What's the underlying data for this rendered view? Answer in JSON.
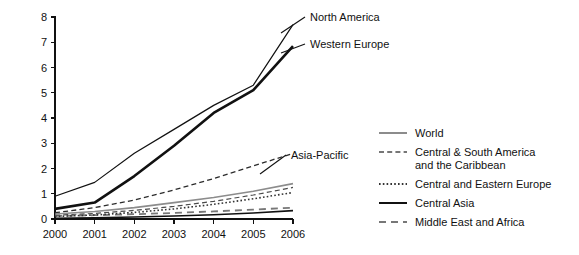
{
  "chart_data": {
    "type": "line",
    "title": "",
    "subtitle": "",
    "xlabel": "",
    "ylabel": "",
    "x": [
      2000,
      2001,
      2002,
      2003,
      2004,
      2005,
      2006
    ],
    "xtick_labels": [
      "2000",
      "2001",
      "2002",
      "2003",
      "2004",
      "2005",
      "2006"
    ],
    "ytick_labels": [
      "0",
      "1",
      "2",
      "3",
      "4",
      "5",
      "6",
      "7",
      "8"
    ],
    "ytick_values": [
      0,
      1,
      2,
      3,
      4,
      5,
      6,
      7,
      8
    ],
    "xlim": [
      2000,
      2006
    ],
    "ylim": [
      0,
      8
    ],
    "grid": false,
    "legend_position": "right",
    "series": [
      {
        "name": "North America",
        "values": [
          0.9,
          1.45,
          2.6,
          3.55,
          4.5,
          5.3,
          7.7
        ],
        "style": "solid",
        "width": 1.2,
        "color": "#111111",
        "labeled_on_plot": true
      },
      {
        "name": "Western Europe",
        "values": [
          0.4,
          0.65,
          1.7,
          2.9,
          4.2,
          5.1,
          6.85
        ],
        "style": "solid",
        "width": 2.6,
        "color": "#111111",
        "labeled_on_plot": true
      },
      {
        "name": "Asia-Pacific",
        "values": [
          0.25,
          0.45,
          0.75,
          1.15,
          1.6,
          2.1,
          2.6
        ],
        "style": "dashed",
        "width": 1.3,
        "color": "#2b2b2b",
        "labeled_on_plot": true
      },
      {
        "name": "World",
        "values": [
          0.2,
          0.3,
          0.45,
          0.65,
          0.85,
          1.1,
          1.4
        ],
        "style": "solid",
        "width": 1.6,
        "color": "#8c8c8c",
        "labeled_on_plot": false
      },
      {
        "name": "Central & South America and the Caribbean",
        "values": [
          0.15,
          0.22,
          0.34,
          0.5,
          0.7,
          0.95,
          1.25
        ],
        "style": "dashed",
        "width": 1.2,
        "color": "#4a4a4a",
        "labeled_on_plot": false
      },
      {
        "name": "Central and Eastern Europe",
        "values": [
          0.1,
          0.16,
          0.26,
          0.4,
          0.58,
          0.8,
          1.05
        ],
        "style": "dotted",
        "width": 1.6,
        "color": "#333333",
        "labeled_on_plot": false
      },
      {
        "name": "Central Asia",
        "values": [
          0.03,
          0.05,
          0.08,
          0.12,
          0.17,
          0.24,
          0.33
        ],
        "style": "solid",
        "width": 1.6,
        "color": "#111111",
        "labeled_on_plot": false
      },
      {
        "name": "Middle East and Africa",
        "values": [
          0.12,
          0.15,
          0.19,
          0.24,
          0.3,
          0.37,
          0.45
        ],
        "style": "longdash",
        "width": 1.8,
        "color": "#777777",
        "labeled_on_plot": false
      }
    ],
    "plot_annotations": [
      {
        "label": "North America",
        "x": 2006,
        "y": 7.7
      },
      {
        "label": "Western Europe",
        "x": 2006,
        "y": 6.85
      },
      {
        "label": "Asia-Pacific",
        "x": 2006,
        "y": 2.6
      }
    ],
    "legend": {
      "entries": [
        {
          "label": "World",
          "style": "solid",
          "color": "#8c8c8c",
          "width": 2.0
        },
        {
          "label_line1": "Central & South America",
          "label_line2": "and the Caribbean",
          "label": "Central & South America and the Caribbean",
          "style": "dashed",
          "color": "#4a4a4a",
          "width": 1.3
        },
        {
          "label": "Central and Eastern Europe",
          "style": "dotted",
          "color": "#333333",
          "width": 1.8
        },
        {
          "label": "Central Asia",
          "style": "solid",
          "color": "#111111",
          "width": 2.0
        },
        {
          "label": "Middle East and Africa",
          "style": "longdash",
          "color": "#777777",
          "width": 2.0
        }
      ]
    }
  }
}
